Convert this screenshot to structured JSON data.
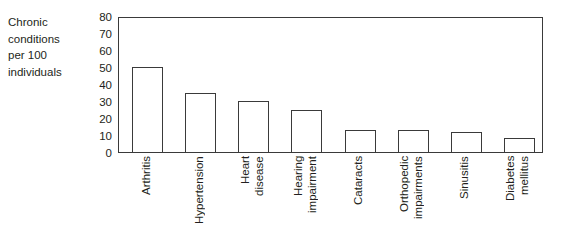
{
  "chart_data": {
    "type": "bar",
    "title": "",
    "xlabel": "",
    "ylabel": "Chronic conditions per 100 individuals",
    "ylabel_lines": "Chronic\nconditions\nper 100\nindividuals",
    "categories": [
      "Arthritis",
      "Hypertension",
      "Heart disease",
      "Hearing impairment",
      "Cataracts",
      "Orthopedic impairments",
      "Sinusitis",
      "Diabetes mellitus"
    ],
    "category_lines": [
      "Arthritis",
      "Hypertension",
      "Heart\ndisease",
      "Hearing\nimpairment",
      "Cataracts",
      "Orthopedic\nimpairments",
      "Sinusitis",
      "Diabetes\nmellitus"
    ],
    "values": [
      50,
      35,
      30,
      25,
      13,
      13,
      12,
      8
    ],
    "ylim": [
      0,
      80
    ],
    "ytick_values": [
      80,
      70,
      60,
      50,
      40,
      30,
      20,
      10,
      0
    ],
    "ytick_labels": [
      "80",
      "70",
      "60",
      "50",
      "40",
      "30",
      "20",
      "10",
      "0"
    ],
    "grid": false,
    "legend": null,
    "legend_position": "none",
    "bar_fill_color": "#ffffff",
    "bar_edge_color": "#3a3a3a",
    "axis_color": "#3a3a3a",
    "text_color": "#231f20",
    "background_color": "#ffffff"
  }
}
